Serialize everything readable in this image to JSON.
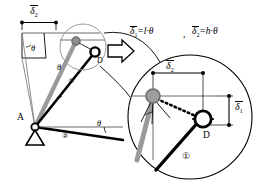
{
  "figure": {
    "type": "kinematic-linkage-diagram",
    "colors": {
      "line": "#000000",
      "gray_link": "#9a9a9a",
      "thin_gray": "#808080",
      "background": "#ffffff"
    }
  },
  "equations": {
    "delta1": "δ",
    "delta1_sub": "1",
    "delta1_rhs": "=l·θ",
    "comma": ",",
    "delta2": "δ",
    "delta2_sub": "2",
    "delta2_rhs": "=h·θ"
  },
  "labels": {
    "delta2_top": {
      "sym": "δ",
      "sub": "2"
    },
    "delta2_detail": {
      "sym": "δ",
      "sub": "2"
    },
    "delta1_detail": {
      "sym": "δ",
      "sub": "1"
    },
    "theta_upper_left": "θ",
    "theta_link1": "θ",
    "theta_link2": "θ",
    "point_a": "A",
    "point_d_main": "D",
    "point_d_detail": "D",
    "link1_main": "①",
    "link2_main": "②",
    "link1_detail": "①"
  }
}
